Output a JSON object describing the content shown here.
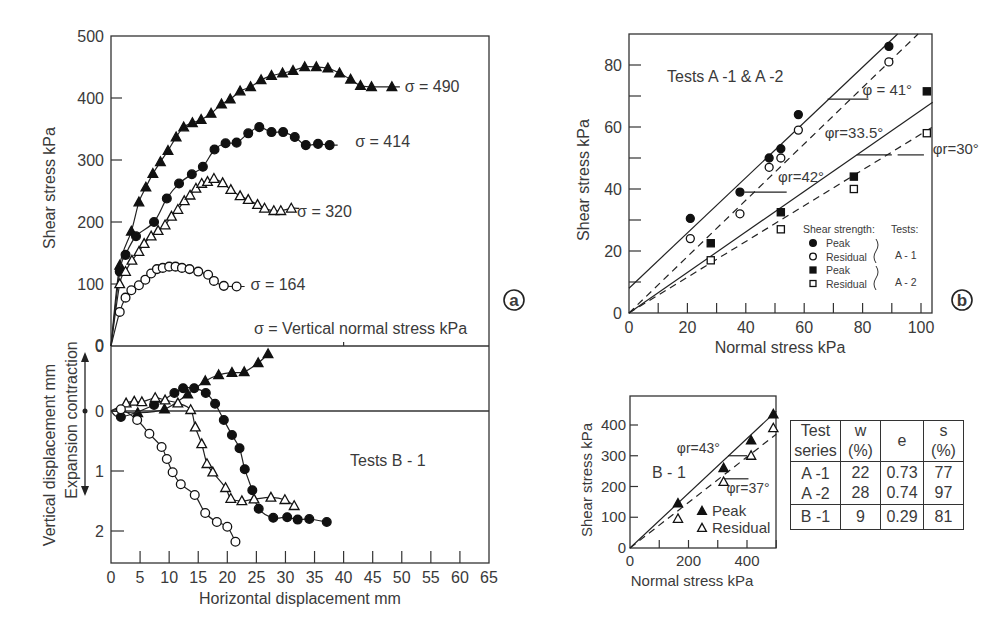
{
  "chart_data": [
    {
      "id": "a-top",
      "type": "line",
      "title": "",
      "xlabel": "Horizontal displacement mm",
      "ylabel": "Shear stress kPa",
      "xlim": [
        0,
        65
      ],
      "ylim": [
        0,
        500
      ],
      "yticks": [
        0,
        100,
        200,
        300,
        400,
        500
      ],
      "annotation": "σ = Vertical normal stress kPa",
      "panel_label": "a",
      "series": [
        {
          "name": "σ = 490",
          "marker": "filled-triangle",
          "x": [
            1.5,
            3.5,
            4.8,
            6,
            7.2,
            8.5,
            9.8,
            11.2,
            12.5,
            14,
            15.5,
            17.2,
            19,
            20.5,
            22.2,
            24,
            25.8,
            27.6,
            29.5,
            31.3,
            33.3,
            35.3,
            37.3,
            39.3,
            41.2,
            42.9,
            44.8,
            48.3
          ],
          "y": [
            130,
            185,
            232,
            256,
            278,
            297,
            315,
            337,
            353,
            360,
            365,
            375,
            390,
            398,
            411,
            418,
            429,
            436,
            440,
            444,
            450,
            450,
            448,
            440,
            430,
            420,
            418,
            418
          ]
        },
        {
          "name": "σ = 414",
          "marker": "filled-circle",
          "x": [
            1.5,
            2.5,
            4.3,
            7.4,
            9.6,
            11.7,
            13.9,
            15.8,
            17.8,
            19.7,
            21.6,
            23.6,
            25.5,
            27.6,
            29.6,
            31.6,
            33.5,
            35.6,
            37.6
          ],
          "y": [
            120,
            147,
            177,
            200,
            238,
            262,
            277,
            289,
            317,
            327,
            328,
            343,
            353,
            345,
            345,
            337,
            324,
            326,
            324
          ]
        },
        {
          "name": "σ = 320",
          "marker": "open-triangle",
          "x": [
            1.5,
            2.5,
            3.6,
            4.8,
            5.7,
            6.9,
            8.1,
            9.3,
            10.4,
            11.5,
            12.6,
            13.6,
            14.6,
            15.6,
            16.6,
            17.7,
            19.2,
            20.6,
            22.2,
            23.6,
            25.2,
            26.4,
            28,
            29.2,
            31
          ],
          "y": [
            100,
            120,
            138,
            152,
            165,
            177,
            186,
            195,
            209,
            220,
            234,
            243,
            254,
            262,
            265,
            270,
            263,
            252,
            242,
            236,
            228,
            222,
            218,
            218,
            222
          ]
        },
        {
          "name": "σ = 164",
          "marker": "open-circle",
          "x": [
            1.5,
            2.5,
            3.5,
            4.8,
            5.9,
            6.9,
            7.9,
            8.9,
            10,
            11.1,
            12.2,
            13.5,
            15,
            16.7,
            17.7,
            19.4,
            21.6
          ],
          "y": [
            55,
            78,
            90,
            98,
            107,
            117,
            124,
            126,
            128,
            128,
            126,
            124,
            120,
            115,
            105,
            97,
            96
          ]
        }
      ],
      "curve_labels": [
        {
          "text": "σ = 490",
          "x": 50.5,
          "y": 420
        },
        {
          "text": "σ = 414",
          "x": 42,
          "y": 331
        },
        {
          "text": "σ = 320",
          "x": 32,
          "y": 218
        },
        {
          "text": "σ = 164",
          "x": 24,
          "y": 100
        }
      ]
    },
    {
      "id": "a-bottom",
      "type": "line",
      "xlabel": "Horizontal displacement mm",
      "ylabel": "Vertical displacement mm",
      "ylabel2": "Expansion contraction",
      "xlim": [
        0,
        65
      ],
      "ylim": [
        -1.08,
        2.55
      ],
      "yticks": [
        0,
        1,
        2
      ],
      "xticks": [
        0,
        5,
        10,
        15,
        20,
        25,
        30,
        35,
        40,
        45,
        50,
        55,
        60,
        65
      ],
      "annotation": "Tests B - 1",
      "series": [
        {
          "name": "σ = 490",
          "marker": "filled-triangle",
          "x": [
            4.6,
            9.2,
            13.2,
            16.2,
            18.5,
            20.8,
            22.9,
            25.3,
            27
          ],
          "y": [
            0.03,
            -0.03,
            -0.28,
            -0.5,
            -0.6,
            -0.64,
            -0.65,
            -0.8,
            -0.95
          ]
        },
        {
          "name": "σ = 414",
          "marker": "filled-circle",
          "x": [
            1.7,
            7.4,
            10.9,
            12.4,
            14.3,
            16.3,
            17.9,
            19.4,
            20.8,
            22.1,
            23,
            24.3,
            25.4,
            27.9,
            30.3,
            32.1,
            34.1,
            37.1
          ],
          "y": [
            0.1,
            -0.1,
            -0.3,
            -0.38,
            -0.38,
            -0.3,
            -0.12,
            0.15,
            0.4,
            0.62,
            0.97,
            1.32,
            1.63,
            1.78,
            1.77,
            1.81,
            1.8,
            1.85
          ]
        },
        {
          "name": "σ = 320",
          "marker": "open-triangle",
          "x": [
            2.6,
            4,
            5.3,
            7.6,
            9.3,
            11.5,
            13.7,
            14.5,
            15.6,
            16.5,
            17.5,
            19.7,
            20.6,
            22.5,
            24.6,
            27.5,
            29.9,
            31.5
          ],
          "y": [
            -0.13,
            -0.16,
            -0.15,
            -0.22,
            -0.18,
            -0.13,
            -0.02,
            0.27,
            0.55,
            0.88,
            1.02,
            1.28,
            1.46,
            1.5,
            1.47,
            1.44,
            1.48,
            1.58
          ]
        },
        {
          "name": "σ = 164",
          "marker": "open-circle",
          "x": [
            1.7,
            4.5,
            6.6,
            8.7,
            9.6,
            10.6,
            12,
            14.4,
            16.2,
            18.2,
            20,
            21.4
          ],
          "y": [
            -0.03,
            0.15,
            0.38,
            0.6,
            0.8,
            1.02,
            1.22,
            1.4,
            1.7,
            1.85,
            1.93,
            2.18
          ]
        }
      ]
    },
    {
      "id": "b",
      "type": "scatter",
      "title": "Tests A -1 & A -2",
      "xlabel": "Normal stress kPa",
      "ylabel": "Shear stress kPa",
      "xlim": [
        0,
        104
      ],
      "ylim": [
        0,
        90
      ],
      "xticks": [
        0,
        20,
        40,
        60,
        80,
        100
      ],
      "yticks": [
        0,
        20,
        40,
        60,
        80
      ],
      "panel_label": "b",
      "series": [
        {
          "name": "A-1 Peak",
          "marker": "filled-circle",
          "x": [
            21,
            38,
            48,
            52,
            58,
            89
          ],
          "y": [
            30.5,
            39,
            50,
            53,
            64,
            86
          ]
        },
        {
          "name": "A-1 Residual",
          "marker": "open-circle",
          "x": [
            21,
            38,
            48,
            52,
            58,
            89
          ],
          "y": [
            24,
            32,
            47,
            50,
            59,
            81
          ]
        },
        {
          "name": "A-2 Peak",
          "marker": "filled-square",
          "x": [
            28,
            52,
            77,
            102
          ],
          "y": [
            22.5,
            32.5,
            44,
            71.5
          ]
        },
        {
          "name": "A-2 Residual",
          "marker": "open-square",
          "x": [
            28,
            52,
            77,
            102
          ],
          "y": [
            17,
            27,
            40,
            58
          ]
        }
      ],
      "fit_lines": [
        {
          "name": "A-1 peak",
          "style": "solid",
          "x": [
            0,
            92
          ],
          "y": [
            8,
            90
          ]
        },
        {
          "name": "A-1 residual",
          "style": "dashed",
          "x": [
            0,
            99
          ],
          "y": [
            0,
            90
          ]
        },
        {
          "name": "A-2 peak",
          "style": "solid",
          "x": [
            0,
            104
          ],
          "y": [
            0,
            68
          ]
        },
        {
          "name": "A-2 residual",
          "style": "dashed",
          "x": [
            0,
            104
          ],
          "y": [
            0,
            60
          ]
        }
      ],
      "angle_labels": [
        {
          "text": "φ = 41°",
          "x": 80,
          "y": 72
        },
        {
          "text": "φr=33.5°",
          "x": 67,
          "y": 58
        },
        {
          "text": "φr=42°",
          "x": 51,
          "y": 44
        },
        {
          "text": "φr=30°",
          "x": 104,
          "y": 53
        }
      ],
      "legend": {
        "header_left": "Shear strength:",
        "header_right": "Tests:",
        "items": [
          "Peak",
          "Residual",
          "Peak",
          "Residual"
        ],
        "groups": [
          "A - 1",
          "A - 2"
        ]
      }
    },
    {
      "id": "b1",
      "type": "scatter",
      "title": "B - 1",
      "xlabel": "Normal stress kPa",
      "ylabel": "Shear stress kPa",
      "xlim": [
        0,
        500
      ],
      "ylim": [
        0,
        495
      ],
      "xticks": [
        0,
        200,
        400
      ],
      "yticks": [
        0,
        100,
        200,
        300,
        400
      ],
      "series": [
        {
          "name": "Peak",
          "marker": "filled-triangle",
          "x": [
            164,
            320,
            414,
            490
          ],
          "y": [
            145,
            260,
            350,
            435
          ]
        },
        {
          "name": "Residual",
          "marker": "open-triangle",
          "x": [
            164,
            320,
            414,
            490
          ],
          "y": [
            95,
            215,
            300,
            390
          ]
        }
      ],
      "fit_lines": [
        {
          "name": "peak",
          "style": "solid",
          "x": [
            0,
            500
          ],
          "y": [
            0,
            445
          ]
        },
        {
          "name": "residual",
          "style": "dashed",
          "x": [
            0,
            500
          ],
          "y": [
            0,
            370
          ]
        }
      ],
      "angle_labels": [
        {
          "text": "φr=43°",
          "x": 160,
          "y": 325
        },
        {
          "text": "φr=37°",
          "x": 330,
          "y": 195
        }
      ],
      "legend": {
        "items": [
          "Peak",
          "Residual"
        ]
      }
    }
  ],
  "table": {
    "headers": [
      [
        "Test",
        "series"
      ],
      [
        "w",
        "(%)"
      ],
      [
        "e",
        ""
      ],
      [
        "s",
        "(%)"
      ]
    ],
    "rows": [
      [
        "A -1",
        "22",
        "0.73",
        "77"
      ],
      [
        "A -2",
        "28",
        "0.74",
        "97"
      ],
      [
        "B -1",
        "9",
        "0.29",
        "81"
      ]
    ]
  },
  "labels": {
    "panel_a": "a",
    "panel_b": "b",
    "a_ylabel_top": "Shear stress kPa",
    "a_ylabel_bottom": "Vertical displacement mm",
    "a_ylabel_bottom2": "Expansion contraction",
    "a_xlabel": "Horizontal displacement mm",
    "a_annotation": "σ = Vertical normal stress kPa",
    "a_tests": "Tests B - 1",
    "b_title": "Tests A -1 & A -2",
    "b_xlabel": "Normal stress kPa",
    "b_ylabel": "Shear stress kPa",
    "b1_title": "B - 1",
    "b1_xlabel": "Normal stress kPa",
    "b1_ylabel": "Shear stress kPa"
  }
}
